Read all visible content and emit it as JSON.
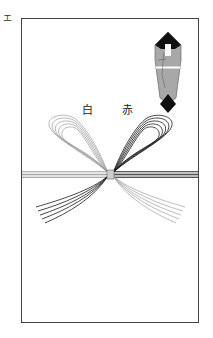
{
  "corner_label": "エ",
  "labels": {
    "white": "白",
    "red": "赤"
  },
  "colors": {
    "border": "#444444",
    "white_cord": "#9a9a9a",
    "red_cord": "#1a1a1a",
    "noshi_body": "#a8a8a8",
    "noshi_tips": "#111111"
  }
}
